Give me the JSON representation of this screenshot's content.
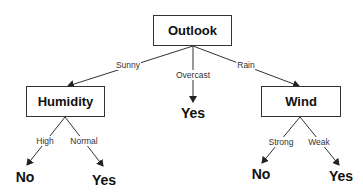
{
  "diagram": {
    "type": "decision-tree",
    "colors": {
      "line": "#333333",
      "text": "#111111",
      "background": "#ffffff"
    },
    "root": {
      "label": "Outlook"
    },
    "nodes": {
      "humidity": {
        "label": "Humidity"
      },
      "wind": {
        "label": "Wind"
      }
    },
    "edges": {
      "sunny": "Sunny",
      "overcast": "Overcast",
      "rain": "Rain",
      "high": "High",
      "normal": "Normal",
      "strong": "Strong",
      "weak": "Weak"
    },
    "leaves": {
      "overcast_yes": "Yes",
      "high_no": "No",
      "normal_yes": "Yes",
      "strong_no": "No",
      "weak_yes": "Yes"
    }
  }
}
